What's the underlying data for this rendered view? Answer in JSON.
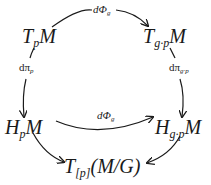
{
  "diagram": {
    "type": "commutative-diagram",
    "nodes": {
      "tl": {
        "base": "T",
        "sub": "p",
        "tail": "M"
      },
      "tr": {
        "base": "T",
        "sub": "g·p",
        "tail": "M"
      },
      "ml": {
        "base": "H",
        "sub": "p",
        "tail": "M"
      },
      "mr": {
        "base": "H",
        "sub": "g·p",
        "tail": "M"
      },
      "bot": {
        "base": "T",
        "sub": "[p]",
        "tail": "(M/G)"
      }
    },
    "edges": [
      {
        "from": "tl",
        "to": "tr",
        "label_main": "dΦ",
        "label_sub": "g"
      },
      {
        "from": "tl",
        "to": "ml",
        "label_main": "dπ",
        "label_sub": "p"
      },
      {
        "from": "tr",
        "to": "mr",
        "label_main": "dπ",
        "label_sub": "g·p"
      },
      {
        "from": "ml",
        "to": "mr",
        "label_main": "dΦ",
        "label_sub": "g"
      },
      {
        "from": "ml",
        "to": "bot",
        "label_main": "",
        "label_sub": ""
      },
      {
        "from": "mr",
        "to": "bot",
        "label_main": "",
        "label_sub": ""
      }
    ]
  }
}
